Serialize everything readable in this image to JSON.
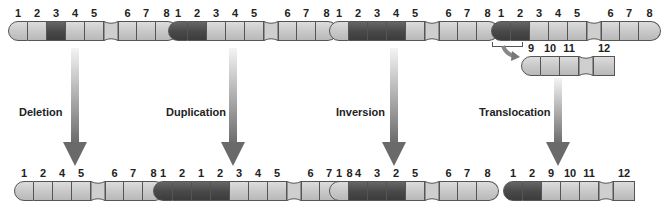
{
  "mutations": [
    {
      "name": "Deletion",
      "before": [
        {
          "n": "1",
          "dark": false
        },
        {
          "n": "2",
          "dark": false
        },
        {
          "n": "3",
          "dark": true
        },
        {
          "n": "4",
          "dark": false
        },
        {
          "n": "5",
          "dark": false
        },
        {
          "n": "|"
        },
        {
          "n": "6",
          "dark": false
        },
        {
          "n": "7",
          "dark": false
        },
        {
          "n": "8",
          "dark": false
        }
      ],
      "after": [
        {
          "n": "1",
          "dark": false
        },
        {
          "n": "2",
          "dark": false
        },
        {
          "n": "4",
          "dark": false
        },
        {
          "n": "5",
          "dark": false
        },
        {
          "n": "|"
        },
        {
          "n": "6",
          "dark": false
        },
        {
          "n": "7",
          "dark": false
        },
        {
          "n": "8",
          "dark": false
        }
      ]
    },
    {
      "name": "Duplication",
      "before": [
        {
          "n": "1",
          "dark": true
        },
        {
          "n": "2",
          "dark": true
        },
        {
          "n": "3",
          "dark": false
        },
        {
          "n": "4",
          "dark": false
        },
        {
          "n": "5",
          "dark": false
        },
        {
          "n": "|"
        },
        {
          "n": "6",
          "dark": false
        },
        {
          "n": "7",
          "dark": false
        },
        {
          "n": "8",
          "dark": false
        }
      ],
      "after": [
        {
          "n": "1",
          "dark": true
        },
        {
          "n": "2",
          "dark": true
        },
        {
          "n": "1",
          "dark": true
        },
        {
          "n": "2",
          "dark": true
        },
        {
          "n": "3",
          "dark": false
        },
        {
          "n": "4",
          "dark": false
        },
        {
          "n": "5",
          "dark": false
        },
        {
          "n": "|"
        },
        {
          "n": "6",
          "dark": false
        },
        {
          "n": "7",
          "dark": false
        },
        {
          "n": "8",
          "dark": false
        }
      ]
    },
    {
      "name": "Inversion",
      "before": [
        {
          "n": "1",
          "dark": false
        },
        {
          "n": "2",
          "dark": true
        },
        {
          "n": "3",
          "dark": true
        },
        {
          "n": "4",
          "dark": true
        },
        {
          "n": "5",
          "dark": false
        },
        {
          "n": "|"
        },
        {
          "n": "6",
          "dark": false
        },
        {
          "n": "7",
          "dark": false
        },
        {
          "n": "8",
          "dark": false
        }
      ],
      "after": [
        {
          "n": "1",
          "dark": false
        },
        {
          "n": "4",
          "dark": true
        },
        {
          "n": "3",
          "dark": true
        },
        {
          "n": "2",
          "dark": true
        },
        {
          "n": "5",
          "dark": false
        },
        {
          "n": "|"
        },
        {
          "n": "6",
          "dark": false
        },
        {
          "n": "7",
          "dark": false
        },
        {
          "n": "8",
          "dark": false
        }
      ]
    },
    {
      "name": "Translocation",
      "before": [
        {
          "n": "1",
          "dark": true
        },
        {
          "n": "2",
          "dark": true
        },
        {
          "n": "3",
          "dark": false
        },
        {
          "n": "4",
          "dark": false
        },
        {
          "n": "5",
          "dark": false
        },
        {
          "n": "|"
        },
        {
          "n": "6",
          "dark": false
        },
        {
          "n": "7",
          "dark": false
        },
        {
          "n": "8",
          "dark": false
        }
      ],
      "partner": [
        {
          "n": "9",
          "dark": false
        },
        {
          "n": "10",
          "dark": false
        },
        {
          "n": "11",
          "dark": false
        },
        {
          "n": "|"
        },
        {
          "n": "12",
          "dark": false
        }
      ],
      "after": [
        {
          "n": "1",
          "dark": true
        },
        {
          "n": "2",
          "dark": true
        },
        {
          "n": "9",
          "dark": false
        },
        {
          "n": "10",
          "dark": false
        },
        {
          "n": "11",
          "dark": false
        },
        {
          "n": "|"
        },
        {
          "n": "12",
          "dark": false
        }
      ]
    }
  ],
  "labels": {
    "deletion": "Deletion",
    "duplication": "Duplication",
    "inversion": "Inversion",
    "translocation": "Translocation"
  },
  "colors": {
    "dark_band": "#4a4a4a",
    "light_band": "#c9c9c9",
    "arrow": "#777777"
  }
}
